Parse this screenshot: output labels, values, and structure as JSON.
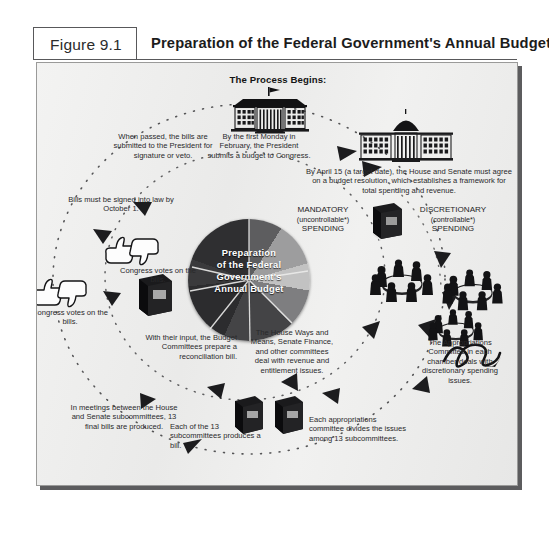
{
  "figure": {
    "number": "Figure 9.1",
    "title": "Preparation of the Federal Government's Annual Budget"
  },
  "diagram": {
    "heading": "The Process Begins:",
    "center_label_lines": [
      "Preparation",
      "of the Federal",
      "Government's",
      "Annual Budget"
    ],
    "center_label": "Preparation of the Federal Government's Annual Budget",
    "spending_categories": [
      {
        "name": "mandatory",
        "line1": "MANDATORY",
        "line2": "(uncontrollable*)",
        "line3": "SPENDING"
      },
      {
        "name": "discretionary",
        "line1": "DISCRETIONARY",
        "line2": "(controllable*)",
        "line3": "SPENDING"
      }
    ],
    "steps": [
      {
        "id": "step-president-budget",
        "text": "By the first Monday in February, the President submits a budget to Congress.",
        "icon": "white-house-icon"
      },
      {
        "id": "step-budget-resolution",
        "text": "By April 15 (a target date), the House and Senate must agree on a budget resolution, which establishes a framework for total spending and revenue.",
        "icon": "capitol-icon"
      },
      {
        "id": "step-appropriations-committee",
        "text": "The Appropriations Committee in each chamber deals with discretionary spending issues.",
        "icon": "committee-table-icon"
      },
      {
        "id": "step-ways-and-means",
        "text": "The House Ways and Means, Senate Finance, and other committees deal with revenue and entitlement issues.",
        "icon": "committee-table-icon"
      },
      {
        "id": "step-appropriations-divides",
        "text": "Each appropriations committee divides the issues among 13 subcommittees.",
        "icon": "budget-book-icon"
      },
      {
        "id": "step-subcommittee-bill",
        "text": "Each of the 13 subcommittees produces a bill.",
        "icon": "budget-book-icon"
      },
      {
        "id": "step-reconciliation",
        "text": "With their input, the Budget Committees prepare a reconciliation bill.",
        "icon": "reconciliation-book-icon"
      },
      {
        "id": "step-conference-meetings",
        "text": "In meetings between the House and Senate subcommittees, 13 final bills are produced.",
        "icon": ""
      },
      {
        "id": "step-congress-votes-1",
        "text": "Congress votes on the bills.",
        "icon": "thumbs-icon"
      },
      {
        "id": "step-congress-votes-2",
        "text": "Congress votes on the bills.",
        "icon": "thumbs-icon"
      },
      {
        "id": "step-signed-into-law",
        "text": "Bills must be signed into law by October 1.",
        "icon": ""
      },
      {
        "id": "step-submitted-to-president",
        "text": "When passed, the bills are submitted to the President for signature or veto.",
        "icon": ""
      }
    ],
    "colors": {
      "panel_background": "#ececeb",
      "panel_border": "#9a9a99",
      "text": "#29292b",
      "pie_dark": "#2f2f31",
      "pie_mid": "#7e7e80",
      "pie_light": "#c2c2c2",
      "arrow": "#1f1f21"
    }
  }
}
